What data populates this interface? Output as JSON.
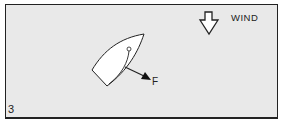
{
  "panel": {
    "number": "3",
    "background_color": "#e9e9e9",
    "border_color": "#222222"
  },
  "wind": {
    "label": "WIND",
    "icon": "down-arrow-outline-icon",
    "direction": "down"
  },
  "boat": {
    "icon": "sailboat-hull-top-view-icon",
    "heading": "up-right",
    "mast": "circle",
    "sail": "curved line from mast to stern"
  },
  "force": {
    "label": "F",
    "icon": "force-arrow-icon",
    "direction": "down-right"
  }
}
